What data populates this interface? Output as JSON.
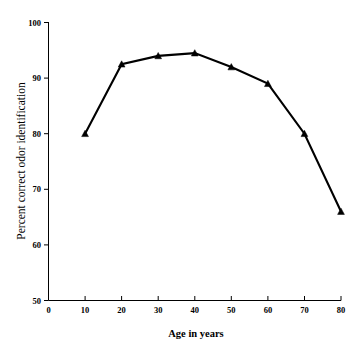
{
  "chart_data": {
    "type": "line",
    "title": "",
    "xlabel": "Age in years",
    "ylabel": "Percent correct odor identification",
    "x": [
      10,
      20,
      30,
      40,
      50,
      60,
      70,
      80
    ],
    "values": [
      80,
      92.5,
      94,
      94.5,
      92,
      89,
      80,
      66
    ],
    "series": [
      {
        "name": "Percent correct odor identification",
        "values": [
          80,
          92.5,
          94,
          94.5,
          92,
          89,
          80,
          66
        ]
      }
    ],
    "xlim": [
      0,
      80
    ],
    "ylim": [
      50,
      100
    ],
    "xticks": [
      0,
      10,
      20,
      30,
      40,
      50,
      60,
      70,
      80
    ],
    "yticks": [
      50,
      60,
      70,
      80,
      90,
      100
    ],
    "xtick_labels": [
      "0",
      "10",
      "20",
      "30",
      "40",
      "50",
      "60",
      "70",
      "80"
    ],
    "ytick_labels": [
      "50",
      "60",
      "70",
      "80",
      "90",
      "100"
    ],
    "grid": false,
    "legend": false,
    "marker": "triangle",
    "line_color": "#000000",
    "marker_color": "#000000",
    "background_color": "#ffffff"
  }
}
